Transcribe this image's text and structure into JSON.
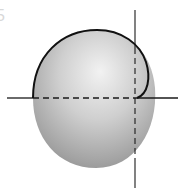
{
  "figure": {
    "corner_label": "5",
    "colors": {
      "background": "#ffffff",
      "sphere_highlight": "#f2f2f2",
      "sphere_mid": "#c4c4c4",
      "sphere_shadow": "#8e8e8e",
      "line": "#1a1a1a"
    },
    "axes": {
      "horizontal": {
        "y": 98,
        "x_start": 7,
        "x_end": 178
      },
      "vertical": {
        "x": 135,
        "y_start": 10,
        "y_end": 188
      }
    },
    "sphere": {
      "cx": 94,
      "cy": 99,
      "rx": 61,
      "ry": 69
    }
  }
}
